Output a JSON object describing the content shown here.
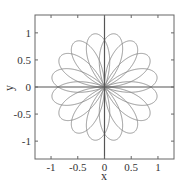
{
  "chart_data": {
    "type": "line",
    "title": "",
    "xlabel": "x",
    "ylabel": "y",
    "xlim": [
      -1.3,
      1.3
    ],
    "ylim": [
      -1.33,
      1.33
    ],
    "grid": false,
    "legend": "none",
    "xticks": [
      -1,
      -0.5,
      0,
      0.5,
      1
    ],
    "xtick_labels": [
      "-1",
      "-0.5",
      "0",
      "0.5",
      "1"
    ],
    "yticks": [
      -1,
      -0.5,
      0,
      0.5,
      1
    ],
    "ytick_labels": [
      "-1",
      "-0.5",
      "0",
      "0.5",
      "1"
    ],
    "series": [
      {
        "name": "rose curve",
        "equation": "r = sin(8θ/3)",
        "k_numerator": 8,
        "k_denominator": 3,
        "theta_range_pi": [
          0,
          6
        ],
        "petals": 16,
        "amplitude": 1,
        "color": "#8a8a8a"
      }
    ],
    "axis_lines_through_origin": true,
    "colors": {
      "curve": "#8a8a8a",
      "axes": "#555555",
      "frame": "#666666"
    }
  }
}
